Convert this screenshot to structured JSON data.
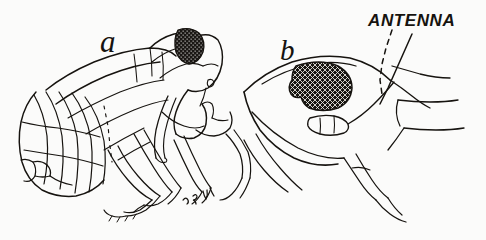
{
  "figure": {
    "kind": "scientific-line-drawing",
    "medium": "pen-and-ink stipple illustration",
    "background_color": "#fbfbfa",
    "ink_color": "#16130f",
    "panels": [
      {
        "id": "a",
        "label": "a",
        "description": "lateral habitus view of insect showing segmented abdomen, folded wing, thorax, head with stippled compound eye and legs"
      },
      {
        "id": "b",
        "label": "b",
        "description": "enlarged oblique view of head showing large cross-hatched compound eye and antenna"
      }
    ],
    "annotations": [
      {
        "text": "ANTENNA",
        "style": "hand-lettered slanted capitals",
        "leader": "dashed line descending left to the antenna base"
      }
    ],
    "signature": {
      "text": "",
      "description": "small illegible cursive artist initials below figure a"
    },
    "caption": {
      "text": "",
      "description": "faint printed caption line cropped at lower edge, illegible"
    }
  }
}
